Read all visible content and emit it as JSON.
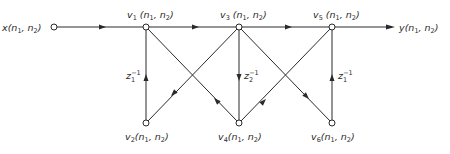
{
  "diagram": {
    "type": "signal-flow-graph",
    "colors": {
      "stroke": "#2a2a2a",
      "background": "#ffffff"
    },
    "input": {
      "id": "x",
      "label": "x",
      "args": [
        "n",
        "1",
        "n",
        "2"
      ],
      "pos": [
        54,
        27
      ]
    },
    "output": {
      "id": "y",
      "label": "y",
      "args": [
        "n",
        "1",
        "n",
        "2"
      ],
      "pos": [
        392,
        27
      ]
    },
    "nodes": [
      {
        "id": "v1",
        "name": "v",
        "sub": "1",
        "pos": [
          146,
          27
        ],
        "label_side": "top"
      },
      {
        "id": "v3",
        "name": "v",
        "sub": "3",
        "pos": [
          239,
          27
        ],
        "label_side": "top"
      },
      {
        "id": "v5",
        "name": "v",
        "sub": "5",
        "pos": [
          332,
          27
        ],
        "label_side": "top"
      },
      {
        "id": "v2",
        "name": "v",
        "sub": "2",
        "pos": [
          146,
          123
        ],
        "label_side": "bottom"
      },
      {
        "id": "v4",
        "name": "v",
        "sub": "4",
        "pos": [
          239,
          123
        ],
        "label_side": "bottom"
      },
      {
        "id": "v6",
        "name": "v",
        "sub": "6",
        "pos": [
          332,
          123
        ],
        "label_side": "bottom"
      }
    ],
    "edges": [
      {
        "from": "x",
        "to": "v1"
      },
      {
        "from": "v1",
        "to": "v3"
      },
      {
        "from": "v3",
        "to": "v5"
      },
      {
        "from": "v5",
        "to": "y"
      },
      {
        "from": "v2",
        "to": "v1",
        "gain": "z1^-1"
      },
      {
        "from": "v3",
        "to": "v4",
        "gain": "z2^-1"
      },
      {
        "from": "v6",
        "to": "v5",
        "gain": "z1^-1"
      },
      {
        "from": "v3",
        "to": "v2"
      },
      {
        "from": "v4",
        "to": "v1"
      },
      {
        "from": "v4",
        "to": "v5"
      },
      {
        "from": "v3",
        "to": "v6"
      }
    ],
    "gain_labels": [
      {
        "edge": "v2-v1",
        "base": "z",
        "sub": "1",
        "sup": "−1"
      },
      {
        "edge": "v3-v4",
        "base": "z",
        "sub": "2",
        "sup": "−1"
      },
      {
        "edge": "v6-v5",
        "base": "z",
        "sub": "1",
        "sup": "−1"
      }
    ],
    "text": {
      "x_label": "x",
      "y_label": "y",
      "v_name": "v",
      "n": "n",
      "sub1": "1",
      "sub2": "2",
      "comma": ", ",
      "open": "(",
      "close": ")",
      "z": "z",
      "minus_one": "−1",
      "v_subs": [
        "1",
        "2",
        "3",
        "4",
        "5",
        "6"
      ]
    }
  }
}
